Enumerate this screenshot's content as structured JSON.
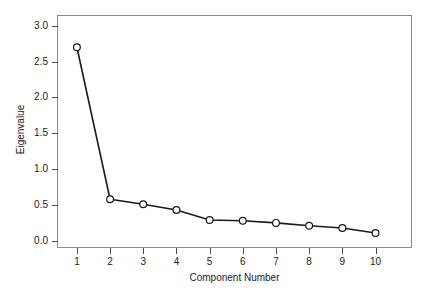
{
  "chart_data": {
    "type": "line",
    "title": "",
    "subtitle": "",
    "xlabel": "Component Number",
    "ylabel": "Eigenvalue",
    "categories": [
      1,
      2,
      3,
      4,
      5,
      6,
      7,
      8,
      9,
      10
    ],
    "x": [
      1,
      2,
      3,
      4,
      5,
      6,
      7,
      8,
      9,
      10
    ],
    "values": [
      2.7,
      0.58,
      0.51,
      0.43,
      0.29,
      0.28,
      0.25,
      0.21,
      0.18,
      0.11
    ],
    "series": [
      {
        "name": "Eigenvalue",
        "values": [
          2.7,
          0.58,
          0.51,
          0.43,
          0.29,
          0.28,
          0.25,
          0.21,
          0.18,
          0.11
        ]
      }
    ],
    "xlim": [
      0.4,
      11.1
    ],
    "ylim": [
      -0.1,
      3.15
    ],
    "xticks": [
      1,
      2,
      3,
      4,
      5,
      6,
      7,
      8,
      9,
      10
    ],
    "xtick_labels": [
      "1",
      "2",
      "3",
      "4",
      "5",
      "6",
      "7",
      "8",
      "9",
      "10"
    ],
    "yticks": [
      0.0,
      0.5,
      1.0,
      1.5,
      2.0,
      2.5,
      3.0
    ],
    "ytick_labels": [
      "0.0",
      "0.5",
      "1.0",
      "1.5",
      "2.0",
      "2.5",
      "3.0"
    ],
    "grid": false,
    "legend": false,
    "legend_position": "none",
    "marker": "open-circle",
    "line_color": "#1a1a1a",
    "marker_fill": "#ffffff",
    "marker_edge_color": "#1a1a1a",
    "axis_color": "#8a8a8a",
    "background_color": "#ffffff"
  }
}
